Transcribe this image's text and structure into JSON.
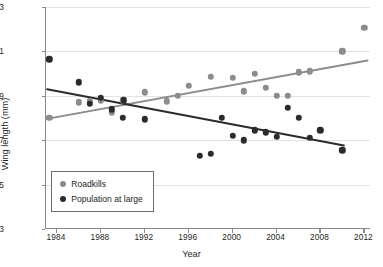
{
  "chart_data": {
    "type": "scatter",
    "title": "",
    "xlabel": "Year",
    "ylabel": "Wing length (mm)",
    "xlim": [
      1983,
      2012.6
    ],
    "ylim": [
      103,
      113
    ],
    "xticks": [
      1984,
      1988,
      1992,
      1996,
      2000,
      2004,
      2008,
      2012
    ],
    "yticks": [
      103,
      105,
      107,
      109,
      111,
      113
    ],
    "grid": "horizontal",
    "legend_position": "lower-left",
    "series": [
      {
        "name": "Roadkills",
        "color": "#8c8c8c",
        "marker": "circle",
        "points": [
          [
            1983.3,
            108.0
          ],
          [
            1986.0,
            108.7
          ],
          [
            1987.0,
            108.75
          ],
          [
            1988.0,
            108.8
          ],
          [
            1989.0,
            108.25
          ],
          [
            1990.0,
            108.8
          ],
          [
            1992.0,
            109.15
          ],
          [
            1994.0,
            108.75
          ],
          [
            1995.0,
            109.0
          ],
          [
            1996.0,
            109.45
          ],
          [
            1998.0,
            109.85
          ],
          [
            2000.0,
            109.8
          ],
          [
            2001.0,
            109.2
          ],
          [
            2002.0,
            110.0
          ],
          [
            2003.0,
            109.35
          ],
          [
            2004.0,
            109.0
          ],
          [
            2005.0,
            109.0
          ],
          [
            2006.0,
            110.05
          ],
          [
            2007.0,
            110.1
          ],
          [
            2010.0,
            111.0
          ],
          [
            2012.0,
            112.05
          ]
        ],
        "trendline": {
          "x1": 1983.0,
          "y1": 107.95,
          "x2": 2012.4,
          "y2": 110.6
        }
      },
      {
        "name": "Population at large",
        "color": "#2b2b2b",
        "marker": "circle",
        "points": [
          [
            1983.3,
            110.65
          ],
          [
            1986.0,
            109.6
          ],
          [
            1987.0,
            108.65
          ],
          [
            1988.0,
            108.9
          ],
          [
            1989.0,
            108.4
          ],
          [
            1990.0,
            108.0
          ],
          [
            1990.1,
            108.8
          ],
          [
            1992.0,
            107.95
          ],
          [
            1997.0,
            106.3
          ],
          [
            1998.0,
            106.4
          ],
          [
            1999.0,
            108.0
          ],
          [
            2000.0,
            107.2
          ],
          [
            2001.0,
            107.0
          ],
          [
            2002.0,
            107.45
          ],
          [
            2003.0,
            107.35
          ],
          [
            2004.0,
            107.15
          ],
          [
            2005.0,
            108.45
          ],
          [
            2006.0,
            108.0
          ],
          [
            2007.0,
            107.1
          ],
          [
            2008.0,
            107.45
          ],
          [
            2010.0,
            106.55
          ]
        ],
        "trendline": {
          "x1": 1983.0,
          "y1": 109.3,
          "x2": 2010.2,
          "y2": 106.75
        }
      }
    ]
  },
  "legend": {
    "items": [
      {
        "label": "Roadkills",
        "color": "#8c8c8c"
      },
      {
        "label": "Population at large",
        "color": "#2b2b2b"
      }
    ]
  },
  "axes": {
    "y_title": "Wing length (mm)",
    "x_title": "Year"
  }
}
